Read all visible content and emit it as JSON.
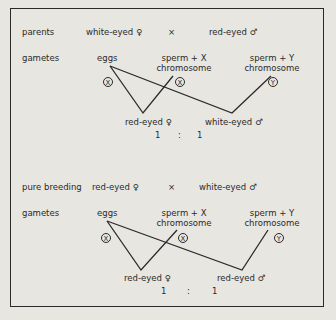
{
  "cross1": {
    "row_label": "parents",
    "female_parent": "white-eyed ♀",
    "cross_symbol": "×",
    "male_parent": "red-eyed ♂",
    "gametes_label": "gametes",
    "eggs": "eggs",
    "sperm_x_line1": "sperm + X",
    "sperm_x_line2": "chromosome",
    "sperm_y_line1": "sperm + Y",
    "sperm_y_line2": "chromosome",
    "egg_chromosome": "X",
    "sperm_x_chromosome": "X",
    "sperm_y_chromosome": "Y",
    "offspring_female": "red-eyed ♀",
    "offspring_male": "white-eyed ♂",
    "ratio_left": "1",
    "ratio_sep": ":",
    "ratio_right": "1"
  },
  "cross2": {
    "row_label": "pure breeding",
    "female_parent": "red-eyed ♀",
    "cross_symbol": "×",
    "male_parent": "white-eyed ♂",
    "gametes_label": "gametes",
    "eggs": "eggs",
    "sperm_x_line1": "sperm + X",
    "sperm_x_line2": "chromosome",
    "sperm_y_line1": "sperm + Y",
    "sperm_y_line2": "chromosome",
    "egg_chromosome": "X",
    "sperm_x_chromosome": "X",
    "sperm_y_chromosome": "Y",
    "offspring_female": "red-eyed ♀",
    "offspring_male": "red-eyed ♂",
    "ratio_left": "1",
    "ratio_sep": ":",
    "ratio_right": "1"
  }
}
